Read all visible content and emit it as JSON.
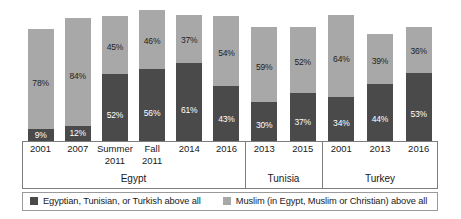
{
  "chart_data": {
    "type": "bar",
    "subtype": "stacked-bar-grouped",
    "title": "",
    "subtitle": "",
    "xlabel": "",
    "ylabel": "",
    "ylim": [
      0,
      105
    ],
    "grid": false,
    "legend_position": "bottom",
    "categories": [
      "2001",
      "2007",
      "Summer 2011",
      "Fall 2011",
      "2014",
      "2016",
      "2013",
      "2015",
      "2001",
      "2013",
      "2016"
    ],
    "series": [
      {
        "name": "Egyptian, Tunisian, or Turkish above all",
        "color": "#4a4a4a",
        "values": [
          9,
          12,
          52,
          56,
          61,
          43,
          30,
          37,
          34,
          44,
          53
        ]
      },
      {
        "name": "Muslim (in Egypt, Muslim or Christian) above all",
        "color": "#a8a8a8",
        "values": [
          78,
          84,
          45,
          46,
          37,
          54,
          59,
          52,
          64,
          39,
          36
        ]
      }
    ],
    "groups": [
      {
        "label": "Egypt",
        "bars": [
          {
            "tick": "2001",
            "tick_line2": "",
            "dark": 9,
            "light": 78,
            "dark_label": "9%",
            "light_label": "78%"
          },
          {
            "tick": "2007",
            "tick_line2": "",
            "dark": 12,
            "light": 84,
            "dark_label": "12%",
            "light_label": "84%"
          },
          {
            "tick": "Summer",
            "tick_line2": "2011",
            "dark": 52,
            "light": 45,
            "dark_label": "52%",
            "light_label": "45%"
          },
          {
            "tick": "Fall",
            "tick_line2": "2011",
            "dark": 56,
            "light": 46,
            "dark_label": "56%",
            "light_label": "46%"
          },
          {
            "tick": "2014",
            "tick_line2": "",
            "dark": 61,
            "light": 37,
            "dark_label": "61%",
            "light_label": "37%"
          },
          {
            "tick": "2016",
            "tick_line2": "",
            "dark": 43,
            "light": 54,
            "dark_label": "43%",
            "light_label": "54%"
          }
        ]
      },
      {
        "label": "Tunisia",
        "bars": [
          {
            "tick": "2013",
            "tick_line2": "",
            "dark": 30,
            "light": 59,
            "dark_label": "30%",
            "light_label": "59%"
          },
          {
            "tick": "2015",
            "tick_line2": "",
            "dark": 37,
            "light": 52,
            "dark_label": "37%",
            "light_label": "52%"
          }
        ]
      },
      {
        "label": "Turkey",
        "bars": [
          {
            "tick": "2001",
            "tick_line2": "",
            "dark": 34,
            "light": 64,
            "dark_label": "34%",
            "light_label": "64%"
          },
          {
            "tick": "2013",
            "tick_line2": "",
            "dark": 44,
            "light": 39,
            "dark_label": "44%",
            "light_label": "39%"
          },
          {
            "tick": "2016",
            "tick_line2": "",
            "dark": 53,
            "light": 36,
            "dark_label": "53%",
            "light_label": "36%"
          }
        ]
      }
    ],
    "legend": [
      {
        "label": "Egyptian, Tunisian, or Turkish above all",
        "color": "#4a4a4a"
      },
      {
        "label": "Muslim (in Egypt, Muslim or Christian) above all",
        "color": "#a8a8a8"
      }
    ],
    "colors": {
      "dark_segment": "#4a4a4a",
      "light_segment": "#a8a8a8",
      "frame": "#7d7d7d",
      "background": "#ffffff",
      "text": "#1a1a1a"
    }
  }
}
